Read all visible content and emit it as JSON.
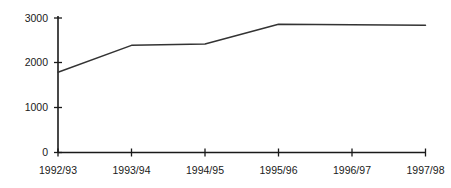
{
  "chart_data": {
    "type": "line",
    "title": "",
    "subtitle": "",
    "xlabel": "",
    "ylabel": "",
    "categories": [
      "1992/93",
      "1993/94",
      "1994/95",
      "1995/96",
      "1996/97",
      "1997/98"
    ],
    "values": [
      1790,
      2390,
      2420,
      2860,
      2850,
      2840
    ],
    "series": [
      {
        "name": "",
        "values": [
          1790,
          2390,
          2420,
          2860,
          2850,
          2840
        ]
      }
    ],
    "ylim": [
      0,
      3000
    ],
    "yticks": [
      0,
      1000,
      2000,
      3000
    ],
    "ytick_labels": [
      "0",
      "1000",
      "2000",
      "3000"
    ],
    "xtick_labels": [
      "1992/93",
      "1993/94",
      "1994/95",
      "1995/96",
      "1996/97",
      "1997/98"
    ],
    "grid": false,
    "legend": false,
    "legend_position": "none",
    "line_color": "#333333",
    "axis_color": "#1a1a1a",
    "background_color": "#ffffff",
    "markers": false
  },
  "axes": {
    "y_ticks": [
      {
        "label": "3000",
        "value": 3000
      },
      {
        "label": "2000",
        "value": 2000
      },
      {
        "label": "1000",
        "value": 1000
      },
      {
        "label": "0",
        "value": 0
      }
    ],
    "x_ticks": [
      {
        "label": "1992/93"
      },
      {
        "label": "1993/94"
      },
      {
        "label": "1994/95"
      },
      {
        "label": "1995/96"
      },
      {
        "label": "1996/97"
      },
      {
        "label": "1997/98"
      }
    ]
  }
}
